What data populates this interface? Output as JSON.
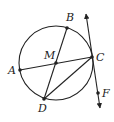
{
  "diagram": {
    "type": "circle-geometry",
    "circle": {
      "cx": 56,
      "cy": 63,
      "r": 37
    },
    "points": {
      "A": {
        "label": "A",
        "x": 20,
        "y": 70,
        "lx": 8,
        "ly": 74
      },
      "B": {
        "label": "B",
        "x": 67,
        "y": 28,
        "lx": 66,
        "ly": 21
      },
      "C": {
        "label": "C",
        "x": 92,
        "y": 57,
        "lx": 96,
        "ly": 61
      },
      "D": {
        "label": "D",
        "x": 44,
        "y": 99,
        "lx": 38,
        "ly": 112
      },
      "M": {
        "label": "M",
        "x": 56,
        "y": 63,
        "lx": 44,
        "ly": 59
      },
      "F": {
        "label": "F",
        "x": 98,
        "y": 93,
        "lx": 102,
        "ly": 97
      }
    },
    "segments": [
      {
        "name": "chord-AC",
        "from": "A",
        "to": "C"
      },
      {
        "name": "chord-BD",
        "from": "B",
        "to": "D"
      },
      {
        "name": "chord-DC",
        "from": "D",
        "to": "C"
      }
    ],
    "tangent_line": {
      "name": "tangent-line-CF",
      "x1": 84,
      "y1": 12,
      "x2": 100,
      "y2": 110,
      "arrows": "both"
    },
    "colors": {
      "stroke": "#222222",
      "background": "#ffffff"
    }
  }
}
